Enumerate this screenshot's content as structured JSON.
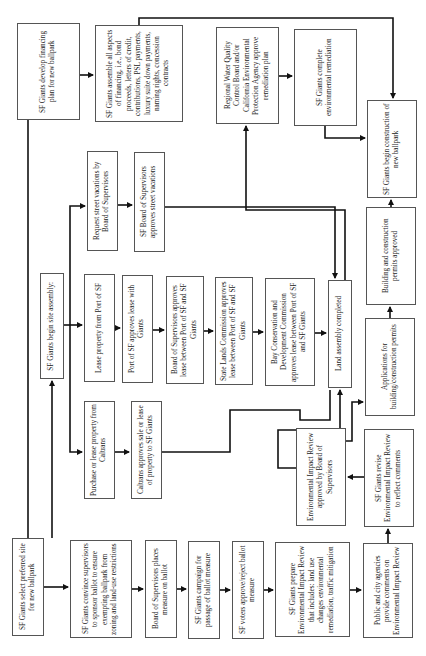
{
  "diagram": {
    "orientation": "rotated 90° counter-clockwise (text reads bottom-to-top)",
    "nodes": [
      {
        "id": "select_site",
        "label": "SF Giants select preferred site for new ballpark",
        "x": 12,
        "y": 538,
        "w": 32,
        "h": 98
      },
      {
        "id": "convince_supervisors",
        "label": "SF Giants convince supervisors to sponsor ballot to ensure exempting ballpark from zoning and land-use restrictions",
        "x": 70,
        "y": 540,
        "w": 62,
        "h": 98
      },
      {
        "id": "ballot_place",
        "label": "Board of Supervisors places measure on ballot",
        "x": 145,
        "y": 540,
        "w": 32,
        "h": 98
      },
      {
        "id": "campaign",
        "label": "SF Giants campaign for passage of ballot measure",
        "x": 188,
        "y": 541,
        "w": 32,
        "h": 98
      },
      {
        "id": "voters",
        "label": "SF voters approve/reject ballot measure",
        "x": 232,
        "y": 541,
        "w": 32,
        "h": 98
      },
      {
        "id": "eir_prepare",
        "label": "SF Giants prepare Environmental Impact Review that includes: land use changes environmental remediation, traffic mitigation",
        "x": 275,
        "y": 542,
        "w": 75,
        "h": 95
      },
      {
        "id": "public_comments",
        "label": "Public and city agencies provide comments on Environmental Impact Review",
        "x": 363,
        "y": 543,
        "w": 50,
        "h": 95
      },
      {
        "id": "eir_revise",
        "label": "SF Giants revise Environmental Impact Review to reflect comments",
        "x": 364,
        "y": 429,
        "w": 50,
        "h": 98
      },
      {
        "id": "eir_approved",
        "label": "Environmental Impact Review approved by Board of Supervisors",
        "x": 296,
        "y": 428,
        "w": 50,
        "h": 98
      },
      {
        "id": "begin_assembly",
        "label": "SF Giants begin site assembly:",
        "x": 40,
        "y": 273,
        "w": 24,
        "h": 106
      },
      {
        "id": "caltrans_purchase",
        "label": "Purchase or lease property from Caltrans",
        "x": 84,
        "y": 401,
        "w": 31,
        "h": 98
      },
      {
        "id": "caltrans_approve",
        "label": "Caltrans approves sale or lease of property to SF Giants",
        "x": 131,
        "y": 401,
        "w": 31,
        "h": 98
      },
      {
        "id": "lease_port",
        "label": "Lease property from Port of SF",
        "x": 84,
        "y": 274,
        "w": 31,
        "h": 108
      },
      {
        "id": "port_approves",
        "label": "Port of SF approves lease with Giants",
        "x": 122,
        "y": 275,
        "w": 31,
        "h": 108
      },
      {
        "id": "bos_lease",
        "label": "Board of Supervisors approves lease between Port of SF and SF Giants",
        "x": 166,
        "y": 276,
        "w": 38,
        "h": 108
      },
      {
        "id": "state_lands",
        "label": "State Lands Commission approves lease between Port of SF and SF Giants",
        "x": 215,
        "y": 277,
        "w": 38,
        "h": 108
      },
      {
        "id": "bcdc",
        "label": "Bay Conservation and Development Commission approves lease between Port of SF and SF Giants",
        "x": 265,
        "y": 278,
        "w": 50,
        "h": 108
      },
      {
        "id": "land_complete",
        "label": "Land assembly completed",
        "x": 328,
        "y": 280,
        "w": 24,
        "h": 108
      },
      {
        "id": "street_request",
        "label": "Request street vacations by Board of Supervisors",
        "x": 87,
        "y": 151,
        "w": 31,
        "h": 100
      },
      {
        "id": "street_approve",
        "label": "SF Board of Supervisors approves street vacations",
        "x": 134,
        "y": 152,
        "w": 31,
        "h": 100
      },
      {
        "id": "financing_plan",
        "label": "SF Giants develop financing plan for new ballpark",
        "x": 17,
        "y": 23,
        "w": 63,
        "h": 97
      },
      {
        "id": "financing_assemble",
        "label": "SF Giants assemble all aspects of financing, i.e., bond proceeds, letters of credit, contributions, PSL payments, luxury suite down payments, naming rights, concession contracts",
        "x": 95,
        "y": 25,
        "w": 88,
        "h": 97
      },
      {
        "id": "water_board",
        "label": "Regional Water Quality Control Board and/or California Environmental Protection Agency approve remediation plan",
        "x": 216,
        "y": 27,
        "w": 63,
        "h": 97
      },
      {
        "id": "remediation",
        "label": "SF Giants complete environmental remediation",
        "x": 294,
        "y": 29,
        "w": 63,
        "h": 97
      },
      {
        "id": "begin_construction",
        "label": "SF Giants begin construction of new ballpark",
        "x": 367,
        "y": 100,
        "w": 50,
        "h": 98
      },
      {
        "id": "permits_apply",
        "label": "Applications for building/construction permits",
        "x": 365,
        "y": 318,
        "w": 50,
        "h": 98
      },
      {
        "id": "permits_approved",
        "label": "Building and construction permits approved",
        "x": 366,
        "y": 207,
        "w": 50,
        "h": 98
      }
    ]
  }
}
